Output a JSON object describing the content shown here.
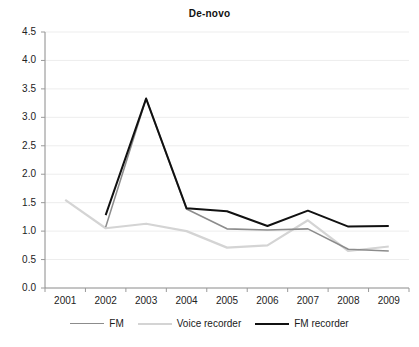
{
  "chart_data": {
    "type": "line",
    "title": "De-novo",
    "xlabel": "",
    "ylabel": "",
    "categories": [
      "2001",
      "2002",
      "2003",
      "2004",
      "2005",
      "2006",
      "2007",
      "2008",
      "2009"
    ],
    "ylim": [
      0.0,
      4.5
    ],
    "ytick_labels": [
      "0.0",
      "0.5",
      "1.0",
      "1.5",
      "2.0",
      "2.5",
      "3.0",
      "3.5",
      "4.0",
      "4.5"
    ],
    "ytick_values": [
      0.0,
      0.5,
      1.0,
      1.5,
      2.0,
      2.5,
      3.0,
      3.5,
      4.0,
      4.5
    ],
    "grid": true,
    "grid_axis": "y",
    "legend_position": "bottom",
    "series": [
      {
        "name": "FM",
        "color": "#8c8c8c",
        "width": 1.6,
        "values": [
          null,
          1.07,
          3.33,
          1.39,
          1.04,
          1.02,
          1.04,
          0.68,
          0.65
        ]
      },
      {
        "name": "Voice recorder",
        "color": "#d4d4d4",
        "width": 2.2,
        "values": [
          1.55,
          1.05,
          1.13,
          1.0,
          0.71,
          0.75,
          1.19,
          0.65,
          0.73
        ]
      },
      {
        "name": "FM recorder",
        "color": "#111111",
        "width": 2.0,
        "values": [
          null,
          1.28,
          3.33,
          1.4,
          1.35,
          1.09,
          1.36,
          1.08,
          1.09
        ]
      }
    ]
  },
  "axes": {
    "axis_color": "#8a8a8a",
    "grid_color": "#ededed",
    "tick_color": "#9a9a9a"
  },
  "legend": {
    "items": [
      {
        "label": "FM",
        "color": "#8c8c8c",
        "width": 1.6
      },
      {
        "label": "Voice recorder",
        "color": "#d4d4d4",
        "width": 2.2
      },
      {
        "label": "FM recorder",
        "color": "#111111",
        "width": 2.0
      }
    ]
  }
}
